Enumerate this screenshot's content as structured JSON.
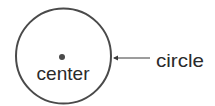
{
  "diagram": {
    "shape": "circle",
    "labels": {
      "center": "center",
      "circle": "circle"
    },
    "colors": {
      "stroke": "#4a4a4a",
      "dot": "#4a4a4a",
      "text": "#2a2a2a",
      "background": "#ffffff"
    }
  }
}
